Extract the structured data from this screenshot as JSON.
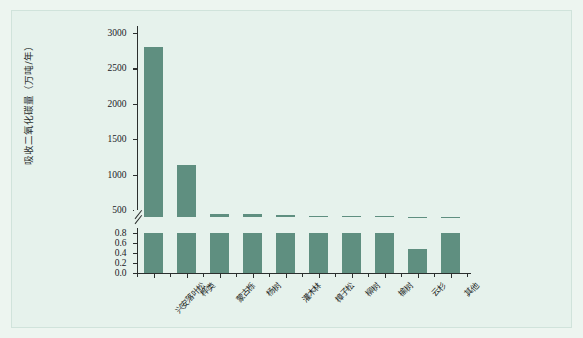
{
  "figure": {
    "background_color": "#e6f2ec",
    "bar_color": "#5f8f80",
    "axis_color": "#2b2f2e"
  },
  "chart_data": {
    "type": "bar",
    "title": "",
    "xlabel": "",
    "ylabel": "吸收二氧化碳量（万吨/年）",
    "broken_axis": true,
    "grid": false,
    "legend": null,
    "categories": [
      "兴安落叶松",
      "桦类",
      "蒙古栎",
      "杨树",
      "灌木林",
      "樟子松",
      "柳树",
      "榆树",
      "云杉",
      "其他"
    ],
    "values": [
      2810,
      1130,
      170,
      150,
      90,
      80,
      40,
      35,
      20,
      30
    ],
    "upper_panel": {
      "ylim": [
        400,
        3100
      ],
      "ticks": [
        500,
        1000,
        1500,
        2000,
        2500,
        3000
      ],
      "tick_labels": [
        "500",
        "1000",
        "1500",
        "2000",
        "2500",
        "3000"
      ]
    },
    "lower_panel": {
      "ylim": [
        0.0,
        0.9
      ],
      "ticks": [
        0.0,
        0.2,
        0.4,
        0.6,
        0.8
      ],
      "tick_labels": [
        "0.0",
        "0.2",
        "0.4",
        "0.6",
        "0.8"
      ],
      "displayed_fractions": [
        0.9,
        0.9,
        0.9,
        0.9,
        0.9,
        0.9,
        0.88,
        0.88,
        0.53,
        0.88
      ]
    }
  }
}
